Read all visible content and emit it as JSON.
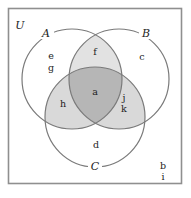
{
  "figure": {
    "type": "venn-diagram",
    "sets": 3,
    "colors": {
      "frame": "#8f8f8f",
      "circle_stroke": "#7a7a7a",
      "background": "#ffffff",
      "shade_pair": "#d9d9d9",
      "shade_pair_light": "#e2e2e2",
      "shade_triple": "#b6b6b6",
      "text": "#1d1d1d"
    }
  },
  "universe": {
    "label": "U"
  },
  "sets": [
    {
      "id": "A",
      "label": "A",
      "cx": 72,
      "cy": 79,
      "r": 50,
      "label_x": 46,
      "label_y": 33
    },
    {
      "id": "B",
      "label": "B",
      "cx": 119,
      "cy": 79,
      "r": 50,
      "label_x": 146,
      "label_y": 33
    },
    {
      "id": "C",
      "label": "C",
      "cx": 95,
      "cy": 117,
      "r": 50,
      "label_x": 95,
      "label_y": 166
    }
  ],
  "regions": [
    {
      "id": "r-a",
      "label": "a",
      "region": "A-and-B-and-C",
      "shaded": "triple",
      "x": 95,
      "y": 92
    },
    {
      "id": "r-f",
      "label": "f",
      "region": "A-and-B-only",
      "shaded": "pair",
      "x": 95,
      "y": 52
    },
    {
      "id": "r-h",
      "label": "h",
      "region": "A-and-C-only",
      "shaded": "pair",
      "x": 63,
      "y": 104
    },
    {
      "id": "r-j",
      "label": "j",
      "region": "B-and-C-only",
      "shaded": "pair",
      "x": 124,
      "y": 98
    },
    {
      "id": "r-k",
      "label": "k",
      "region": "B-and-C-only",
      "shaded": "pair",
      "x": 124,
      "y": 109
    },
    {
      "id": "r-e",
      "label": "e",
      "region": "A-only",
      "shaded": "none",
      "x": 51,
      "y": 56
    },
    {
      "id": "r-g",
      "label": "g",
      "region": "A-only",
      "shaded": "none",
      "x": 51,
      "y": 68
    },
    {
      "id": "r-c",
      "label": "c",
      "region": "B-only",
      "shaded": "none",
      "x": 142,
      "y": 57
    },
    {
      "id": "r-d",
      "label": "d",
      "region": "C-only",
      "shaded": "none",
      "x": 96,
      "y": 145
    },
    {
      "id": "r-b",
      "label": "b",
      "region": "outside-all",
      "shaded": "none",
      "x": 163,
      "y": 166
    },
    {
      "id": "r-i",
      "label": "i",
      "region": "outside-all",
      "shaded": "none",
      "x": 163,
      "y": 177
    }
  ]
}
